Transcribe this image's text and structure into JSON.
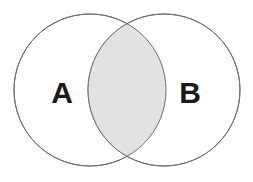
{
  "figure": {
    "type": "venn-diagram",
    "title": "",
    "background_color": "#ffffff",
    "width": 253,
    "height": 182
  },
  "style": {
    "circle_fill": "#ffffff",
    "circle_stroke": "#6e6e6e",
    "circle_stroke_width": 1,
    "intersection_fill": "#e2e2e2",
    "intersection_stroke": "#6e6e6e",
    "label_color": "#1a1a1a"
  },
  "sets": [
    {
      "id": "set-a",
      "label": "A",
      "cx": 90,
      "cy": 90,
      "r": 76,
      "label_x": 62,
      "label_y": 92,
      "fill": "#ffffff"
    },
    {
      "id": "set-b",
      "label": "B",
      "cx": 164,
      "cy": 90,
      "r": 76,
      "label_x": 190,
      "label_y": 92,
      "fill": "#ffffff"
    }
  ],
  "intersection": {
    "id": "set-a-intersect-b",
    "label": "",
    "fill": "#e2e2e2",
    "shaded": true,
    "left_x": 89,
    "right_x": 165,
    "top_y": 21,
    "bottom_y": 159
  }
}
